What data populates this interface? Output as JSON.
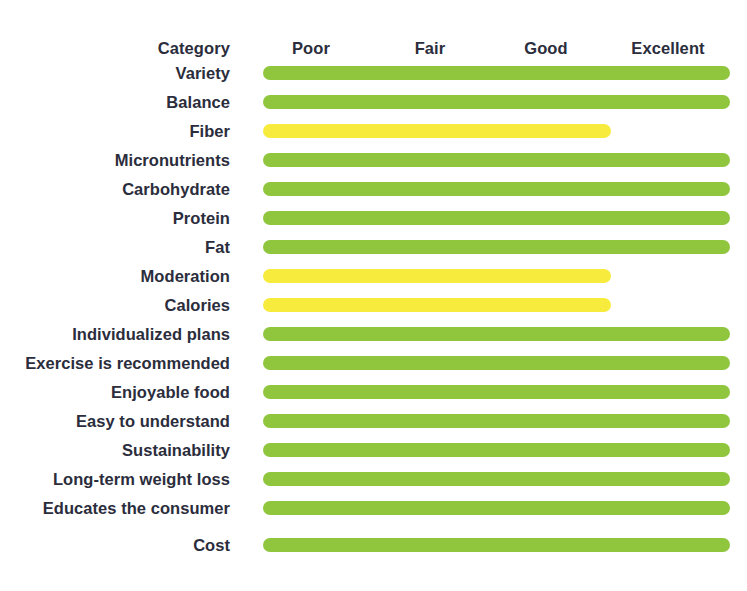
{
  "chart_data": {
    "type": "bar",
    "orientation": "horizontal",
    "title": "",
    "subtitle": "",
    "xlabel": "",
    "ylabel": "",
    "grid": false,
    "legend_position": "none",
    "axis_header": "Category",
    "tick_labels": [
      "Poor",
      "Fair",
      "Good",
      "Excellent"
    ],
    "scale_values": [
      1,
      2,
      3,
      4
    ],
    "xlim": [
      0.5,
      4.5
    ],
    "colors": {
      "excellent": "#8fc63d",
      "good": "#f7ec3d",
      "text": "#2b2d3c",
      "background": "#ffffff"
    },
    "categories": [
      "Variety",
      "Balance",
      "Fiber",
      "Micronutrients",
      "Carbohydrate",
      "Protein",
      "Fat",
      "Moderation",
      "Calories",
      "Individualized plans",
      "Exercise is recommended",
      "Enjoyable food",
      "Easy to understand",
      "Sustainability",
      "Long-term weight loss",
      "Educates the consumer",
      "Cost"
    ],
    "ratings": [
      "Excellent",
      "Excellent",
      "Good",
      "Excellent",
      "Excellent",
      "Excellent",
      "Excellent",
      "Good",
      "Good",
      "Excellent",
      "Excellent",
      "Excellent",
      "Excellent",
      "Excellent",
      "Excellent",
      "Excellent",
      "Excellent"
    ],
    "values": [
      4,
      4,
      3,
      4,
      4,
      4,
      4,
      3,
      3,
      4,
      4,
      4,
      4,
      4,
      4,
      4,
      4
    ],
    "bars": [
      {
        "label": "Variety",
        "rating": "Excellent",
        "value": 4,
        "pct": 100,
        "color": "#8fc63d"
      },
      {
        "label": "Balance",
        "rating": "Excellent",
        "value": 4,
        "pct": 100,
        "color": "#8fc63d"
      },
      {
        "label": "Fiber",
        "rating": "Good",
        "value": 3,
        "pct": 74.5,
        "color": "#f7ec3d"
      },
      {
        "label": "Micronutrients",
        "rating": "Excellent",
        "value": 4,
        "pct": 100,
        "color": "#8fc63d"
      },
      {
        "label": "Carbohydrate",
        "rating": "Excellent",
        "value": 4,
        "pct": 100,
        "color": "#8fc63d"
      },
      {
        "label": "Protein",
        "rating": "Excellent",
        "value": 4,
        "pct": 100,
        "color": "#8fc63d"
      },
      {
        "label": "Fat",
        "rating": "Excellent",
        "value": 4,
        "pct": 100,
        "color": "#8fc63d"
      },
      {
        "label": "Moderation",
        "rating": "Good",
        "value": 3,
        "pct": 74.5,
        "color": "#f7ec3d"
      },
      {
        "label": "Calories",
        "rating": "Good",
        "value": 3,
        "pct": 74.5,
        "color": "#f7ec3d"
      },
      {
        "label": "Individualized plans",
        "rating": "Excellent",
        "value": 4,
        "pct": 100,
        "color": "#8fc63d"
      },
      {
        "label": "Exercise is recommended",
        "rating": "Excellent",
        "value": 4,
        "pct": 100,
        "color": "#8fc63d"
      },
      {
        "label": "Enjoyable food",
        "rating": "Excellent",
        "value": 4,
        "pct": 100,
        "color": "#8fc63d"
      },
      {
        "label": "Easy to understand",
        "rating": "Excellent",
        "value": 4,
        "pct": 100,
        "color": "#8fc63d"
      },
      {
        "label": "Sustainability",
        "rating": "Excellent",
        "value": 4,
        "pct": 100,
        "color": "#8fc63d"
      },
      {
        "label": "Long-term weight loss",
        "rating": "Excellent",
        "value": 4,
        "pct": 100,
        "color": "#8fc63d"
      },
      {
        "label": "Educates the consumer",
        "rating": "Excellent",
        "value": 4,
        "pct": 100,
        "color": "#8fc63d"
      },
      {
        "label": "Cost",
        "rating": "Excellent",
        "value": 4,
        "pct": 100,
        "color": "#8fc63d"
      }
    ]
  },
  "header": {
    "category_label": "Category",
    "ticks": [
      {
        "label": "Poor",
        "x": 311
      },
      {
        "label": "Fair",
        "x": 430
      },
      {
        "label": "Good",
        "x": 546
      },
      {
        "label": "Excellent",
        "x": 668
      }
    ]
  }
}
